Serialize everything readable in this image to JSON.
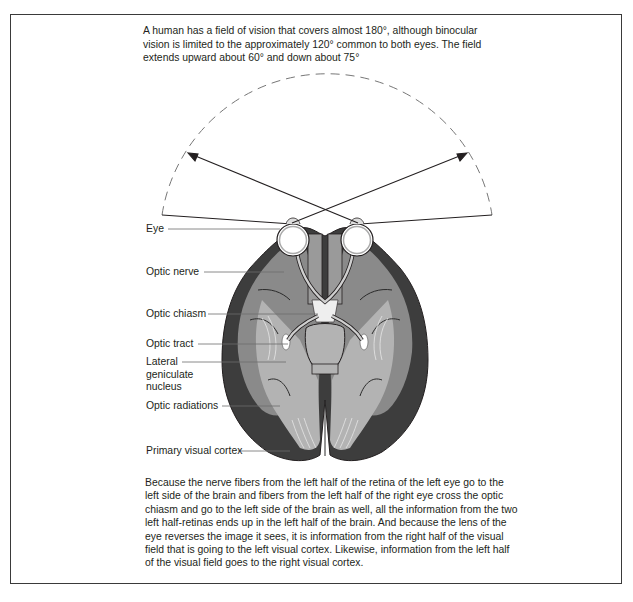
{
  "figure": {
    "intro_text": "A human has a field of vision that covers almost 180°, although binocular vision is limited to the approximately 120° common to both eyes. The field extends upward about 60° and down about 75°",
    "outro_text": "Because the nerve fibers from the left half of the retina of the left eye go to the left side of the brain and fibers from the left half of the right eye cross the optic chiasm and go to the left side of the brain as well, all the information from the two left half-retinas ends up in the left half of the brain. And because the lens of the eye reverses the image it sees, it is information from the right half of the visual field that is going to the left visual cortex. Likewise, information from the left half of the visual field goes to the right visual cortex.",
    "labels": {
      "eye": "Eye",
      "optic_nerve": "Optic nerve",
      "optic_chiasm": "Optic chiasm",
      "optic_tract": "Optic tract",
      "lateral_geniculate_nucleus": "Lateral\ngeniculate\nnucleus",
      "optic_radiations": "Optic radiations",
      "primary_visual_cortex": "Primary visual cortex"
    },
    "field_of_vision": {
      "total_degrees": "180°",
      "binocular_degrees": "120°",
      "upward_degrees": "60°",
      "downward_degrees": "75°"
    },
    "colors": {
      "outline": "#231f20",
      "dark_cortex": "#3d3d3d",
      "mid_cortex": "#8a8a8a",
      "light_cortex": "#b3b3b3",
      "pale": "#d9d9d9",
      "dashed_arc": "#777777",
      "leader_line": "#6d6d6d"
    }
  }
}
